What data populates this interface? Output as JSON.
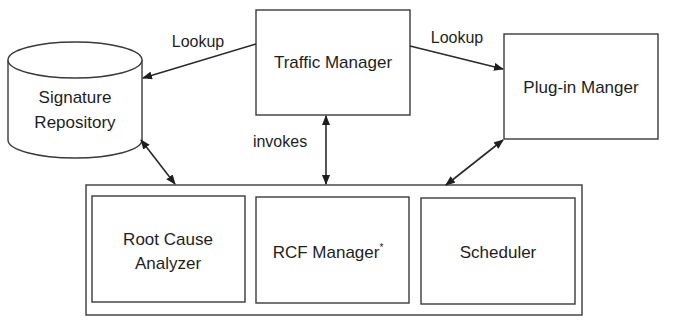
{
  "diagram": {
    "type": "architecture-block-diagram",
    "nodes": {
      "signature_repository": {
        "label_line1": "Signature",
        "label_line2": "Repository",
        "shape": "cylinder"
      },
      "traffic_manager": {
        "label": "Traffic Manager",
        "shape": "rectangle"
      },
      "plugin_manager": {
        "label": "Plug-in Manger",
        "shape": "rectangle"
      },
      "container": {
        "shape": "rectangle",
        "children": [
          "root_cause_analyzer",
          "rcf_manager",
          "scheduler"
        ]
      },
      "root_cause_analyzer": {
        "label_line1": "Root Cause",
        "label_line2": "Analyzer",
        "shape": "rectangle"
      },
      "rcf_manager": {
        "label": "RCF Manager",
        "superscript": "*",
        "shape": "rectangle"
      },
      "scheduler": {
        "label": "Scheduler",
        "shape": "rectangle"
      }
    },
    "edges": [
      {
        "from": "traffic_manager",
        "to": "signature_repository",
        "label": "Lookup",
        "direction": "one-way"
      },
      {
        "from": "traffic_manager",
        "to": "plugin_manager",
        "label": "Lookup",
        "direction": "one-way"
      },
      {
        "from": "traffic_manager",
        "to": "container",
        "label": "invokes",
        "direction": "two-way"
      },
      {
        "from": "signature_repository",
        "to": "container",
        "label": "",
        "direction": "two-way"
      },
      {
        "from": "plugin_manager",
        "to": "container",
        "label": "",
        "direction": "two-way"
      }
    ],
    "colors": {
      "stroke": "#3a3a3a",
      "text": "#1e1e1e",
      "background": "#ffffff"
    }
  }
}
